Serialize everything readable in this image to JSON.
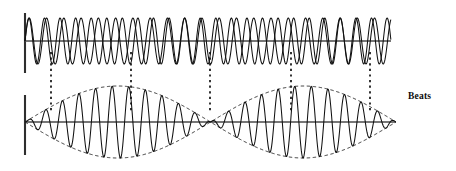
{
  "figure": {
    "title_label": "Beats",
    "background_color": "#ffffff",
    "stroke_color": "#1a1a1a",
    "axis_color": "#3a3a3a",
    "envelope_color": "#2b2b2b",
    "connector_color": "#111111"
  },
  "panels": [
    {
      "name": "component-waves",
      "axis_y": 41,
      "axis_x_start": 25,
      "axis_x_end": 391,
      "vertical_bar": {
        "x": 25,
        "y_top": 13,
        "y_bottom": 73
      },
      "waves": [
        {
          "name": "wave-1",
          "frequency_cycles": 23.5,
          "amplitude": 23,
          "phase_deg": 0
        },
        {
          "name": "wave-2",
          "frequency_cycles": 21.2,
          "amplitude": 23,
          "phase_deg": 0
        }
      ]
    },
    {
      "name": "resultant-beat-wave",
      "axis_y": 122,
      "axis_x_start": 25,
      "axis_x_end": 396,
      "vertical_bar": {
        "x": 25,
        "y_top": 95,
        "y_bottom": 155
      },
      "carrier_frequency_cycles": 22.35,
      "beat_periods": 2,
      "envelope_amplitude": 36,
      "envelope_dashed": true,
      "nodes_x": [
        51,
        210,
        370
      ]
    }
  ],
  "connectors": {
    "name": "beat-node-connectors",
    "style": "dotted",
    "y_top": 52,
    "y_bottom": 113,
    "x_positions": [
      51,
      131,
      210,
      291,
      370
    ]
  },
  "chart_data": {
    "type": "line",
    "title": "Beats",
    "xlabel": "",
    "ylabel": "",
    "grid": false,
    "legend": "none",
    "series": [
      {
        "name": "component-wave-1",
        "panel": "top",
        "frequency_cycles": 23.5,
        "amplitude": 1.0
      },
      {
        "name": "component-wave-2",
        "panel": "top",
        "frequency_cycles": 21.2,
        "amplitude": 1.0
      },
      {
        "name": "resultant-wave",
        "panel": "bottom",
        "carrier_cycles": 22.35,
        "beat_cycles": 2,
        "amplitude": 2.0
      },
      {
        "name": "envelope-upper",
        "panel": "bottom",
        "style": "dashed",
        "beat_cycles": 2,
        "amplitude": 2.0
      },
      {
        "name": "envelope-lower",
        "panel": "bottom",
        "style": "dashed",
        "beat_cycles": 2,
        "amplitude": -2.0
      }
    ],
    "annotations": [
      {
        "text": "Beats",
        "x": 410,
        "y": 98
      }
    ],
    "xlim": [
      25,
      391
    ],
    "ylim": [
      -2.2,
      2.2
    ]
  }
}
